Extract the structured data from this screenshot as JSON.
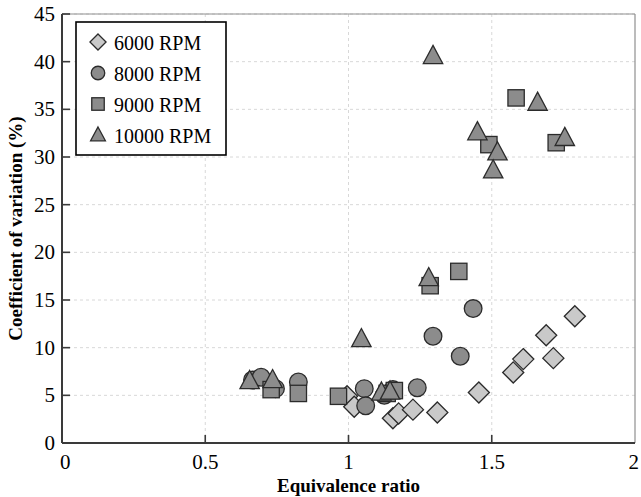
{
  "chart_data": {
    "type": "scatter",
    "title": "",
    "xlabel": "Equivalence ratio",
    "ylabel": "Coefficient of variation (%)",
    "xlim": [
      0,
      2
    ],
    "ylim": [
      0,
      45
    ],
    "xticks": [
      "0",
      "0.5",
      "1",
      "1.5",
      "2"
    ],
    "xtick_values": [
      0,
      0.5,
      1,
      1.5,
      2
    ],
    "yticks": [
      "0",
      "5",
      "10",
      "15",
      "20",
      "25",
      "30",
      "35",
      "40",
      "45"
    ],
    "ytick_values": [
      0,
      5,
      10,
      15,
      20,
      25,
      30,
      35,
      40,
      45
    ],
    "grid": true,
    "legend_position": "top-left",
    "series": [
      {
        "name": "6000 RPM",
        "marker": "diamond",
        "color": "#c9c9c9",
        "edge_color": "#2b2b2b",
        "points": [
          [
            0.995,
            4.9
          ],
          [
            1.02,
            3.8
          ],
          [
            1.155,
            2.6
          ],
          [
            1.175,
            3.1
          ],
          [
            1.225,
            3.5
          ],
          [
            1.31,
            3.2
          ],
          [
            1.455,
            5.3
          ],
          [
            1.575,
            7.4
          ],
          [
            1.61,
            8.8
          ],
          [
            1.69,
            11.3
          ],
          [
            1.715,
            8.9
          ],
          [
            1.79,
            13.3
          ]
        ]
      },
      {
        "name": "8000 RPM",
        "marker": "circle",
        "color": "#8c8c8c",
        "edge_color": "#2b2b2b",
        "points": [
          [
            0.665,
            6.6
          ],
          [
            0.695,
            6.9
          ],
          [
            0.745,
            5.7
          ],
          [
            0.825,
            6.4
          ],
          [
            1.055,
            5.7
          ],
          [
            1.06,
            3.9
          ],
          [
            1.125,
            5.0
          ],
          [
            1.155,
            5.6
          ],
          [
            1.24,
            5.8
          ],
          [
            1.295,
            11.2
          ],
          [
            1.39,
            9.1
          ],
          [
            1.435,
            14.1
          ]
        ]
      },
      {
        "name": "9000 RPM",
        "marker": "square",
        "color": "#8c8c8c",
        "edge_color": "#2b2b2b",
        "points": [
          [
            0.73,
            5.6
          ],
          [
            0.825,
            5.2
          ],
          [
            0.965,
            4.9
          ],
          [
            1.135,
            5.2
          ],
          [
            1.16,
            5.5
          ],
          [
            1.285,
            16.5
          ],
          [
            1.385,
            18.0
          ],
          [
            1.49,
            31.3
          ],
          [
            1.585,
            36.2
          ],
          [
            1.725,
            31.5
          ]
        ]
      },
      {
        "name": "10000 RPM",
        "marker": "triangle",
        "color": "#8c8c8c",
        "edge_color": "#2b2b2b",
        "points": [
          [
            0.655,
            6.5
          ],
          [
            0.735,
            6.6
          ],
          [
            1.115,
            5.3
          ],
          [
            1.145,
            5.4
          ],
          [
            1.045,
            10.9
          ],
          [
            1.28,
            17.3
          ],
          [
            1.295,
            40.6
          ],
          [
            1.45,
            32.6
          ],
          [
            1.52,
            30.5
          ],
          [
            1.505,
            28.6
          ],
          [
            1.66,
            35.7
          ],
          [
            1.755,
            32.0
          ]
        ]
      }
    ]
  },
  "legend": {
    "entries": [
      {
        "label": "6000 RPM",
        "marker": "diamond"
      },
      {
        "label": "8000 RPM",
        "marker": "circle"
      },
      {
        "label": "9000 RPM",
        "marker": "square"
      },
      {
        "label": "10000 RPM",
        "marker": "triangle"
      }
    ]
  }
}
